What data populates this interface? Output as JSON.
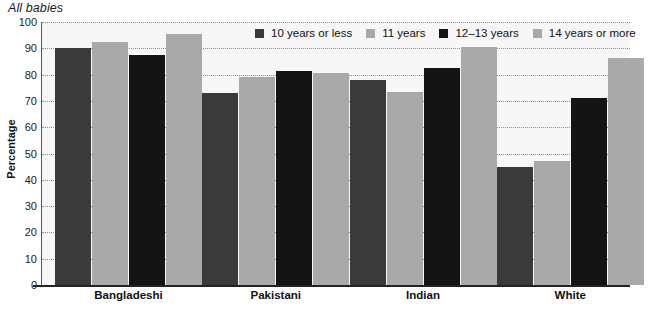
{
  "chart_data": {
    "type": "bar",
    "title": "All babies",
    "xlabel": "",
    "ylabel": "Percentage",
    "ylim": [
      0,
      100
    ],
    "yticks": [
      0,
      10,
      20,
      30,
      40,
      50,
      60,
      70,
      80,
      90,
      100
    ],
    "grid": true,
    "legend_position": "top-center",
    "categories": [
      "Bangladeshi",
      "Pakistani",
      "Indian",
      "White"
    ],
    "series": [
      {
        "name": "10 years or less",
        "color": "#3a3a3a",
        "values": [
          90,
          73,
          78,
          45
        ]
      },
      {
        "name": "11 years",
        "color": "#a9a9a9",
        "values": [
          92.5,
          79,
          73.5,
          47
        ]
      },
      {
        "name": "12–13 years",
        "color": "#141414",
        "values": [
          87.5,
          81.5,
          82.5,
          71
        ]
      },
      {
        "name": "14 years or more",
        "color": "#a9a9a9",
        "values": [
          95.5,
          80.5,
          90.5,
          86.5
        ]
      }
    ]
  },
  "icons": {
    "legend_swatch": "filled-square-icon"
  }
}
